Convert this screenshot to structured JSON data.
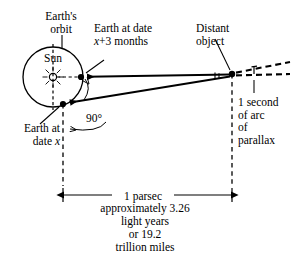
{
  "diagram": {
    "type": "astronomy-geometry-diagram",
    "labels": {
      "earths_orbit": "Earth's\norbit",
      "sun": "Sun",
      "earth_at_date_x3": "Earth at date\nx+3 months",
      "earth_at_date_x": "Earth at\ndate x",
      "distant_object": "Distant\nobject",
      "angle_90": "90°",
      "parallax": "1 second\nof arc\nof\nparallax",
      "parsec": "1 parsec",
      "parsec_detail": "approximately 3.26\nlight years\nor 19.2\ntrillion miles"
    },
    "values": {
      "angle_right": "90°",
      "parallax_angle": "1 second of arc",
      "distance": "1 parsec",
      "light_years": "3.26",
      "miles": "19.2 trillion"
    },
    "colors": {
      "ink": "#000000",
      "paper": "#ffffff"
    }
  }
}
